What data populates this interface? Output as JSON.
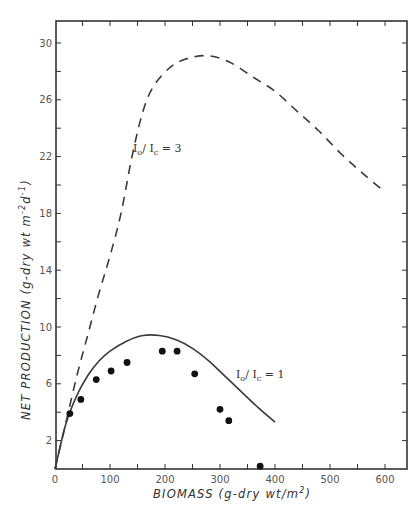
{
  "chart_data": {
    "type": "line",
    "title": "",
    "xlabel": "BIOMASS (g-dry wt/m²)",
    "ylabel": "NET PRODUCTION (g-dry wt m⁻²d⁻¹)",
    "xlim": [
      0,
      636
    ],
    "ylim": [
      0,
      31.5
    ],
    "x_ticks": [
      0,
      100,
      200,
      300,
      400,
      500,
      600
    ],
    "x_minor_ticks": [
      50,
      150,
      250,
      350,
      450,
      550,
      650
    ],
    "y_ticks": [
      2,
      6,
      10,
      14,
      18,
      22,
      26,
      30
    ],
    "y_minor_ticks": [
      4,
      8,
      12,
      16,
      20,
      24,
      28
    ],
    "grid": false,
    "legend": "inline annotations",
    "series": [
      {
        "name": "I₀/I꜀ = 1",
        "style": "solid",
        "label_position": [
          330,
          6.6
        ],
        "x": [
          0,
          20,
          40,
          60,
          80,
          100,
          130,
          160,
          190,
          220,
          250,
          280,
          310,
          340,
          370,
          400
        ],
        "y": [
          0,
          3.2,
          5.2,
          6.6,
          7.6,
          8.3,
          9.0,
          9.4,
          9.4,
          9.1,
          8.5,
          7.6,
          6.5,
          5.4,
          4.3,
          3.3
        ]
      },
      {
        "name": "I₀/I꜀ = 3",
        "style": "dashed",
        "label_position": [
          142,
          22.4
        ],
        "x": [
          0,
          20,
          40,
          60,
          80,
          100,
          120,
          140,
          160,
          180,
          210,
          240,
          280,
          320,
          360,
          400,
          440,
          480,
          520,
          560,
          600
        ],
        "y": [
          0,
          3.3,
          6.6,
          9.5,
          12.4,
          15.0,
          18.0,
          22.0,
          25.2,
          27.0,
          28.3,
          28.9,
          29.1,
          28.6,
          27.6,
          26.6,
          25.2,
          23.8,
          22.2,
          20.8,
          19.5
        ]
      },
      {
        "name": "observed",
        "style": "points",
        "x": [
          27,
          47,
          75,
          102,
          131,
          195,
          222,
          254,
          300,
          316,
          373
        ],
        "y": [
          3.9,
          4.9,
          6.3,
          6.9,
          7.5,
          8.3,
          8.3,
          6.7,
          4.2,
          3.4,
          0.2
        ]
      }
    ]
  },
  "labels": {
    "xlabel_main": "BIOMASS (g-dry wt/m",
    "xlabel_sup": "2",
    "xlabel_end": ")",
    "ylabel_main": "NET PRODUCTION (g-dry wt m",
    "ylabel_sup1": "-2",
    "ylabel_mid": "d",
    "ylabel_sup2": "-1",
    "ylabel_end": ")",
    "anno1_I": "I",
    "anno1_o": "o",
    "anno1_slash": "/ I",
    "anno1_c": "c",
    "anno1_eq": " = 1",
    "anno3_I": "I",
    "anno3_o": "o",
    "anno3_slash": "/ I",
    "anno3_c": "c",
    "anno3_eq": " = 3"
  },
  "colors": {
    "line": "#3a3a3a",
    "axis": "#333333",
    "points": "#111111"
  }
}
